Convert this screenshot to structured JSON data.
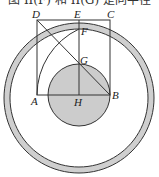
{
  "caption": "图 II(F) 和 II(G) 是同半径",
  "figure": {
    "labels": {
      "A": "A",
      "B": "B",
      "C": "C",
      "D": "D",
      "E": "E",
      "F": "F",
      "G": "G",
      "H": "H"
    },
    "colors": {
      "stroke": "#333333",
      "ring_fill": "#cfcfcf",
      "disk_fill": "#cccccc"
    }
  }
}
